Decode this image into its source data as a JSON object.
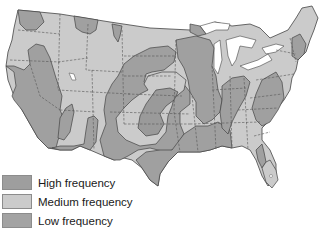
{
  "map": {
    "title": "",
    "region": "Contiguous United States",
    "colors": {
      "high": "#9e9e9e",
      "medium": "#cbcbcb",
      "low": "#a6a6a6",
      "water": "#ffffff",
      "state_border": "#555555",
      "outline": "#444444"
    }
  },
  "legend": {
    "items": [
      {
        "label": "High frequency",
        "color": "#9e9e9e"
      },
      {
        "label": "Medium frequency",
        "color": "#cbcbcb"
      },
      {
        "label": "Low frequency",
        "color": "#a3a3a3"
      }
    ]
  }
}
